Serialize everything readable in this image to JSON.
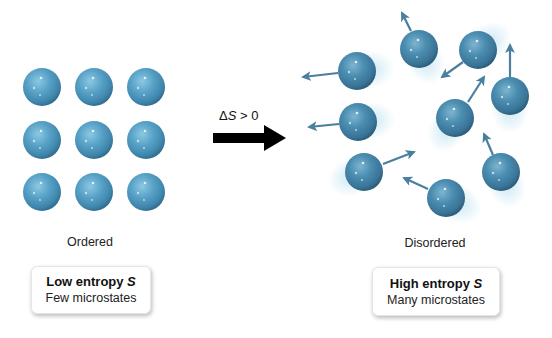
{
  "figure": {
    "type": "entropy-diagram",
    "colors": {
      "ordered_sphere": "#5aa3c8",
      "disordered_sphere": "#4a8db0",
      "velocity_arrow": "#4a7f9e",
      "process_arrow": "#000000",
      "motion_blur": "#bfe2f0"
    }
  },
  "process": {
    "label_symbol": "Δ",
    "label_variable": "S",
    "label_relation": " > 0"
  },
  "ordered": {
    "state_label": "Ordered",
    "box_title_text": "Low entropy ",
    "box_title_var": "S",
    "box_subtitle": "Few microstates",
    "spheres": [
      {
        "cx": 42,
        "cy": 87
      },
      {
        "cx": 94,
        "cy": 87
      },
      {
        "cx": 146,
        "cy": 87
      },
      {
        "cx": 42,
        "cy": 140
      },
      {
        "cx": 94,
        "cy": 140
      },
      {
        "cx": 146,
        "cy": 140
      },
      {
        "cx": 42,
        "cy": 192
      },
      {
        "cx": 94,
        "cy": 192
      },
      {
        "cx": 146,
        "cy": 192
      }
    ]
  },
  "disordered": {
    "state_label": "Disordered",
    "box_title_text": "High entropy ",
    "box_title_var": "S",
    "box_subtitle": "Many microstates",
    "spheres": [
      {
        "cx": 357,
        "cy": 71,
        "ax1": 338,
        "ay1": 73,
        "ax2": 303,
        "ay2": 77
      },
      {
        "cx": 419,
        "cy": 49,
        "ax1": 411,
        "ay1": 31,
        "ax2": 402,
        "ay2": 13
      },
      {
        "cx": 478,
        "cy": 50,
        "ax1": 463,
        "ay1": 62,
        "ax2": 442,
        "ay2": 77
      },
      {
        "cx": 510,
        "cy": 96,
        "ax1": 510,
        "ay1": 77,
        "ax2": 510,
        "ay2": 45
      },
      {
        "cx": 455,
        "cy": 118,
        "ax1": 468,
        "ay1": 102,
        "ax2": 484,
        "ay2": 77
      },
      {
        "cx": 358,
        "cy": 122,
        "ax1": 339,
        "ay1": 124,
        "ax2": 309,
        "ay2": 127
      },
      {
        "cx": 364,
        "cy": 172,
        "ax1": 383,
        "ay1": 164,
        "ax2": 414,
        "ay2": 152
      },
      {
        "cx": 501,
        "cy": 172,
        "ax1": 493,
        "ay1": 155,
        "ax2": 484,
        "ay2": 134
      },
      {
        "cx": 446,
        "cy": 198,
        "ax1": 428,
        "ay1": 189,
        "ax2": 404,
        "ay2": 178
      }
    ]
  }
}
